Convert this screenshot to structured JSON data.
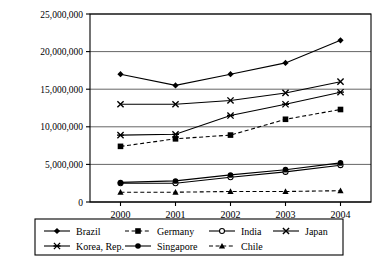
{
  "chart_data": {
    "type": "line",
    "title": "",
    "xlabel": "",
    "ylabel": "",
    "categories": [
      "2000",
      "2001",
      "2002",
      "2003",
      "2004"
    ],
    "ylim": [
      0,
      25000000
    ],
    "yticks": [
      0,
      5000000,
      10000000,
      15000000,
      20000000,
      25000000
    ],
    "ytick_labels": [
      "0",
      "5,000,000",
      "10,000,000",
      "15,000,000",
      "20,000,000",
      "25,000,000"
    ],
    "grid": true,
    "legend_position": "bottom",
    "series": [
      {
        "name": "Brazil",
        "marker": "filled-diamond",
        "dash": "solid",
        "values": [
          17000000,
          15500000,
          17000000,
          18500000,
          21500000
        ]
      },
      {
        "name": "Germany",
        "marker": "filled-square",
        "dash": "dashed",
        "values": [
          7400000,
          8400000,
          8900000,
          11000000,
          12300000
        ]
      },
      {
        "name": "India",
        "marker": "hollow-circle",
        "dash": "solid",
        "values": [
          2500000,
          2500000,
          3300000,
          4000000,
          4900000
        ]
      },
      {
        "name": "Japan",
        "marker": "cross-x",
        "dash": "solid",
        "values": [
          13000000,
          13000000,
          13500000,
          14500000,
          16000000
        ]
      },
      {
        "name": "Korea, Rep.",
        "marker": "star",
        "dash": "solid",
        "values": [
          8900000,
          9000000,
          11500000,
          13000000,
          14600000
        ]
      },
      {
        "name": "Singapore",
        "marker": "filled-circle",
        "dash": "solid",
        "values": [
          2600000,
          2800000,
          3600000,
          4300000,
          5200000
        ]
      },
      {
        "name": "Chile",
        "marker": "filled-triangle",
        "dash": "dashed",
        "values": [
          1300000,
          1300000,
          1400000,
          1400000,
          1500000
        ]
      }
    ]
  },
  "legend": {
    "entries": [
      {
        "label": "Brazil"
      },
      {
        "label": "Germany"
      },
      {
        "label": "India"
      },
      {
        "label": "Japan"
      },
      {
        "label": "Korea, Rep."
      },
      {
        "label": "Singapore"
      },
      {
        "label": "Chile"
      }
    ]
  }
}
